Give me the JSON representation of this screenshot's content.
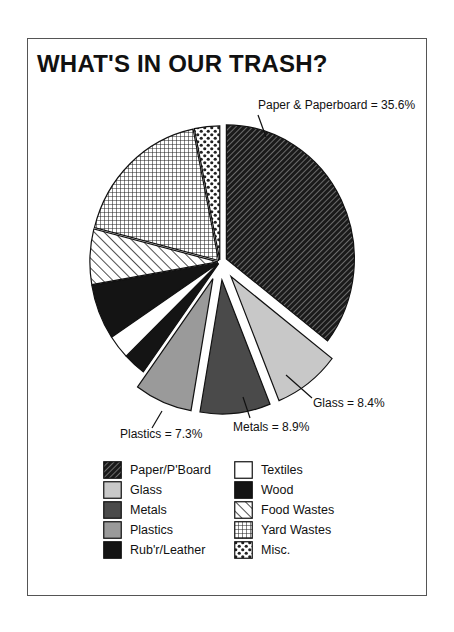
{
  "chart_data": {
    "type": "pie",
    "title": "WHAT'S IN OUR TRASH?",
    "start": "12 o'clock, clockwise",
    "exploded": [
      "Glass",
      "Metals",
      "Plastics"
    ],
    "slices": [
      {
        "name": "Paper/P'Board",
        "value": 35.6,
        "pattern": "diag-dark",
        "callout": "Paper & Paperboard = 35.6%"
      },
      {
        "name": "Glass",
        "value": 8.4,
        "pattern": "light-gray",
        "callout": "Glass = 8.4%"
      },
      {
        "name": "Metals",
        "value": 8.9,
        "pattern": "dark-gray",
        "callout": "Metals = 8.9%"
      },
      {
        "name": "Plastics",
        "value": 7.3,
        "pattern": "mid-gray",
        "callout": "Plastics = 7.3%"
      },
      {
        "name": "Rub'r/Leather",
        "value": 2.8,
        "pattern": "black"
      },
      {
        "name": "Textiles",
        "value": 2.9,
        "pattern": "white"
      },
      {
        "name": "Wood",
        "value": 6.6,
        "pattern": "black"
      },
      {
        "name": "Food Wastes",
        "value": 6.7,
        "pattern": "diag-light"
      },
      {
        "name": "Yard Wastes",
        "value": 17.9,
        "pattern": "grid"
      },
      {
        "name": "Misc.",
        "value": 3.2,
        "pattern": "checker"
      }
    ]
  },
  "legend": {
    "left": [
      {
        "label": "Paper/P'Board",
        "pattern": "diag-dark"
      },
      {
        "label": "Glass",
        "pattern": "light-gray"
      },
      {
        "label": "Metals",
        "pattern": "dark-gray"
      },
      {
        "label": "Plastics",
        "pattern": "mid-gray"
      },
      {
        "label": "Rub'r/Leather",
        "pattern": "black"
      }
    ],
    "right": [
      {
        "label": "Textiles",
        "pattern": "white"
      },
      {
        "label": "Wood",
        "pattern": "black"
      },
      {
        "label": "Food Wastes",
        "pattern": "diag-light"
      },
      {
        "label": "Yard Wastes",
        "pattern": "grid"
      },
      {
        "label": "Misc.",
        "pattern": "checker"
      }
    ]
  },
  "colors": {
    "light-gray": "#c8c8c8",
    "mid-gray": "#9a9a9a",
    "dark-gray": "#4a4a4a",
    "black": "#141414",
    "white": "#ffffff",
    "outline": "#111111"
  }
}
